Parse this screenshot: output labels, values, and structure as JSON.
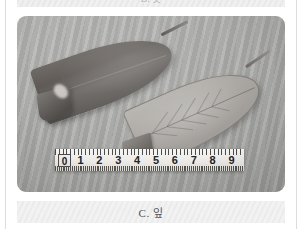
{
  "page": {
    "type": "botanical-plate",
    "background_color": "#ffffff",
    "rule_color": "#dcdcdc"
  },
  "previous_caption": {
    "text": "B. 꽃",
    "note": "clipped sliver of the caption band above"
  },
  "photo": {
    "alt_name": "leaf-specimen-photograph",
    "background_description": "rippled gray sand",
    "base_color": "#ababa9",
    "specimens": [
      {
        "name": "leaf-upper-surface",
        "position": "left",
        "surface": "adaxial",
        "color": "#5c5753",
        "description": "dark elliptic leaf with short petiole"
      },
      {
        "name": "leaf-lower-surface",
        "position": "right",
        "surface": "abaxial",
        "color": "#a9a6a1",
        "description": "pale elliptic leaf showing pinnate venation"
      }
    ]
  },
  "ruler": {
    "name": "scale-ruler",
    "unit": "cm",
    "range_start": 0,
    "range_end": 9,
    "labels": [
      "0",
      "1",
      "2",
      "3",
      "4",
      "5",
      "6",
      "7",
      "8",
      "9"
    ],
    "body_color": "#eceae7",
    "tick_color": "#4a4a48"
  },
  "caption": {
    "label": "C. 잎",
    "color": "#555555",
    "band_color": "#f2f2f2"
  }
}
